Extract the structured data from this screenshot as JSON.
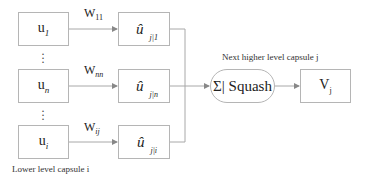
{
  "diagram": {
    "type": "capsule-network-dynamic-routing",
    "lower_capsules": [
      {
        "label": "u",
        "sub": "1"
      },
      {
        "label": "u",
        "sub": "n"
      },
      {
        "label": "u",
        "sub": "i"
      }
    ],
    "weights": [
      {
        "label": "W",
        "sub": "11"
      },
      {
        "label": "W",
        "sub": "nn"
      },
      {
        "label": "W",
        "sub": "ij"
      }
    ],
    "predictions": [
      {
        "label": "û",
        "sub": "j|1"
      },
      {
        "label": "û",
        "sub": "j|n"
      },
      {
        "label": "û",
        "sub": "j|i"
      }
    ],
    "ellipsis": "⋮",
    "squash_node": "Σ| Squash",
    "output": {
      "label": "V",
      "sub": "j"
    },
    "lower_caption": "Lower level capsule i",
    "higher_caption": "Next higher level capsule j",
    "colors": {
      "stroke": "#a8a8a8",
      "text": "#222222",
      "background": "#ffffff"
    }
  }
}
